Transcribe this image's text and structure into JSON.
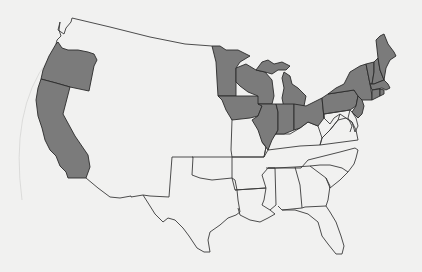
{
  "map": {
    "title": "Continental United States",
    "colors": {
      "background": "#f1f1f0",
      "shaded_fill": "#7b7b7b",
      "unshaded_fill": "none",
      "border": "#3a3a3a"
    },
    "shaded_states": [
      "Oregon",
      "California",
      "Minnesota",
      "Iowa",
      "Wisconsin",
      "Illinois",
      "Michigan",
      "Indiana",
      "Ohio",
      "Pennsylvania",
      "New York",
      "Vermont",
      "New Hampshire",
      "Maine",
      "Massachusetts",
      "Connecticut",
      "Rhode Island",
      "New Jersey"
    ],
    "unshaded_states_with_borders": [
      "Texas",
      "Oklahoma",
      "Arkansas",
      "Louisiana",
      "Mississippi",
      "Alabama",
      "Georgia",
      "Florida",
      "South Carolina",
      "North Carolina",
      "Tennessee",
      "Kentucky",
      "Virginia",
      "West Virginia",
      "Missouri",
      "Maryland",
      "Delaware"
    ]
  }
}
